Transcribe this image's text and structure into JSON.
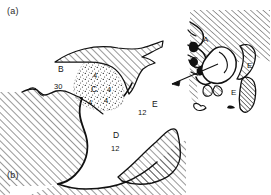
{
  "figure": {
    "panels": [
      {
        "id": "panel-a",
        "label": "(a)",
        "x": 7,
        "y": 6
      },
      {
        "id": "panel-b",
        "label": "(b)",
        "x": 7,
        "y": 170
      }
    ]
  },
  "main_map": {
    "labels": [
      {
        "name": "region-label-B",
        "text": "B",
        "x": 58,
        "y": 72,
        "size": 8.5,
        "weight": "normal"
      },
      {
        "name": "value-label-30",
        "text": "30",
        "x": 54,
        "y": 89,
        "size": 7.5,
        "weight": "normal"
      },
      {
        "name": "region-label-C",
        "text": "C",
        "x": 91,
        "y": 92,
        "size": 8.5,
        "weight": "normal"
      },
      {
        "name": "value-label-4-top",
        "text": "4",
        "x": 93,
        "y": 78,
        "size": 7.5,
        "weight": "normal"
      },
      {
        "name": "value-label-4-right",
        "text": "4",
        "x": 107,
        "y": 92,
        "size": 7.5,
        "weight": "normal"
      },
      {
        "name": "value-label-4-bottom",
        "text": "4",
        "x": 88,
        "y": 105,
        "size": 7.5,
        "weight": "normal"
      },
      {
        "name": "value-label-4-lower-right",
        "text": "4",
        "x": 104,
        "y": 103,
        "size": 7.5,
        "weight": "normal"
      },
      {
        "name": "region-label-D",
        "text": "D",
        "x": 113,
        "y": 138,
        "size": 8.5,
        "weight": "normal"
      },
      {
        "name": "value-label-12-D",
        "text": "12",
        "x": 111,
        "y": 151,
        "size": 7.5,
        "weight": "normal"
      },
      {
        "name": "region-label-E-main",
        "text": "E",
        "x": 152,
        "y": 107,
        "size": 8.5,
        "weight": "normal"
      },
      {
        "name": "value-label-12-E",
        "text": "12",
        "x": 138,
        "y": 115,
        "size": 7.5,
        "weight": "normal"
      }
    ]
  },
  "inset_map": {
    "labels": [
      {
        "name": "inset-region-label-A",
        "text": "A",
        "x": 203,
        "y": 42,
        "size": 8,
        "weight": "normal"
      },
      {
        "name": "inset-region-label-E-upper",
        "text": "E",
        "x": 247,
        "y": 68,
        "size": 8,
        "weight": "normal"
      },
      {
        "name": "inset-region-label-E-lower",
        "text": "E",
        "x": 231,
        "y": 95,
        "size": 8,
        "weight": "normal"
      }
    ]
  },
  "style": {
    "ink": "#141414",
    "hatch": "#1a1a1a",
    "background": "#ffffff"
  }
}
